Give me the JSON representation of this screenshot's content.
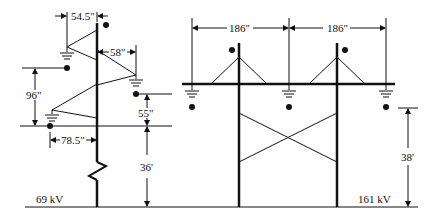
{
  "diagram": {
    "left_tower": {
      "voltage_label": "69 kV",
      "dim_top_offset": "54.5\"",
      "dim_right_arm": "58\"",
      "dim_vertical_spacing": "96\"",
      "dim_lower_drop": "55\"",
      "dim_lower_arm": "78.5\"",
      "dim_height": "36'"
    },
    "right_tower": {
      "voltage_label": "161 kV",
      "dim_phase_spacing_1": "186\"",
      "dim_phase_spacing_2": "186\"",
      "dim_height": "38'"
    },
    "colors": {
      "line": "#111111",
      "background": "#ffffff"
    }
  }
}
